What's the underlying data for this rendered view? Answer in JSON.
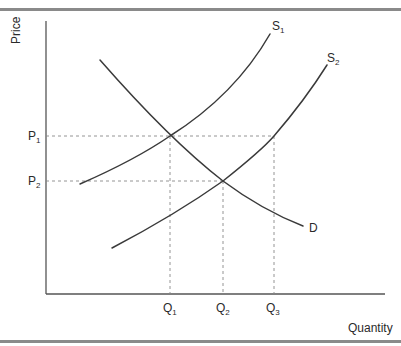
{
  "diagram": {
    "type": "supply-demand",
    "axes": {
      "y_label": "Price",
      "x_label": "Quantity"
    },
    "curves": {
      "supply_1": {
        "label": "S",
        "subscript": "1"
      },
      "supply_2": {
        "label": "S",
        "subscript": "2"
      },
      "demand": {
        "label": "D"
      }
    },
    "price_levels": [
      {
        "label": "P",
        "subscript": "1"
      },
      {
        "label": "P",
        "subscript": "2"
      }
    ],
    "quantity_levels": [
      {
        "label": "Q",
        "subscript": "1"
      },
      {
        "label": "Q",
        "subscript": "2"
      },
      {
        "label": "Q",
        "subscript": "3"
      }
    ],
    "colors": {
      "curve": "#3a3a3a",
      "axis": "#555555",
      "guide": "#888888",
      "rule": "#8a8a8a"
    }
  }
}
